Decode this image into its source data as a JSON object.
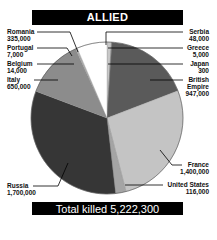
{
  "header": {
    "title": "ALLIED"
  },
  "footer": {
    "total_label": "Total killed 5,222,300"
  },
  "chart_data": {
    "type": "pie",
    "title": "ALLIED",
    "subtitle": "Total killed 5,222,300",
    "total": 5222300,
    "start_angle": "12 o'clock",
    "direction": "clockwise",
    "slices": [
      {
        "label": "Serbia",
        "value": 48000,
        "value_label": "48,000",
        "color": "#c8c8c8"
      },
      {
        "label": "Greece",
        "value": 5000,
        "value_label": "5,000",
        "color": "#9a9a9a"
      },
      {
        "label": "Japan",
        "value": 300,
        "value_label": "300",
        "color": "#777777"
      },
      {
        "label": "British Empire",
        "value": 947000,
        "value_label": "947,000",
        "color": "#5a5a5a"
      },
      {
        "label": "France",
        "value": 1400000,
        "value_label": "1,400,000",
        "color": "#c4c4c4"
      },
      {
        "label": "United States",
        "value": 116000,
        "value_label": "116,000",
        "color": "#a4a4a4"
      },
      {
        "label": "Russia",
        "value": 1700000,
        "value_label": "1,700,000",
        "color": "#363636"
      },
      {
        "label": "Italy",
        "value": 650000,
        "value_label": "650,000",
        "color": "#8c8c8c"
      },
      {
        "label": "Belgium",
        "value": 14000,
        "value_label": "14,000",
        "color": "#b0b0b0"
      },
      {
        "label": "Portugal",
        "value": 7000,
        "value_label": "7,000",
        "color": "#dcdcdc"
      },
      {
        "label": "Romania",
        "value": 335000,
        "value_label": "335,000",
        "color": "#ffffff"
      }
    ]
  },
  "labels": {
    "left": [
      {
        "name": "Romania",
        "value": "335,000"
      },
      {
        "name": "Portugal",
        "value": "7,000"
      },
      {
        "name": "Belgium",
        "value": "14,000"
      },
      {
        "name": "Italy",
        "value": "650,000"
      },
      {
        "name": "Russia",
        "value": "1,700,000"
      }
    ],
    "right": [
      {
        "name": "Serbia",
        "value": "48,000"
      },
      {
        "name": "Greece",
        "value": "5,000"
      },
      {
        "name": "Japan",
        "value": "300"
      },
      {
        "name": "British Empire",
        "name_line1": "British",
        "name_line2": "Empire",
        "value": "947,000"
      },
      {
        "name": "France",
        "value": "1,400,000"
      },
      {
        "name": "United States",
        "value": "116,000"
      }
    ]
  }
}
